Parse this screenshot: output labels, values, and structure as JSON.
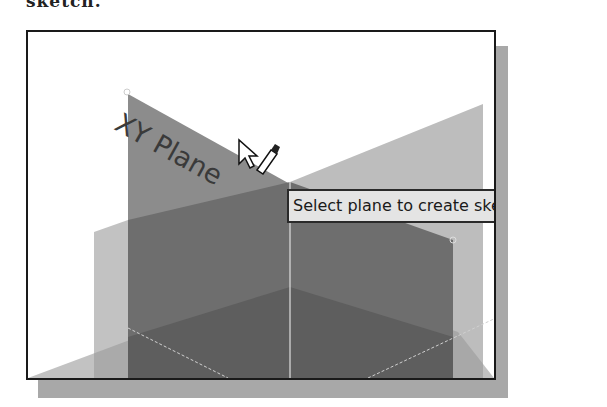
{
  "caption": {
    "text": "sketch."
  },
  "viewport": {
    "planes": [
      {
        "name": "XY Plane",
        "color": "#8c8c8c"
      },
      {
        "name": "back-plane",
        "color": "#bdbdbd"
      },
      {
        "name": "front-plane",
        "color": "#6e6e6e"
      },
      {
        "name": "floor-plane",
        "color": "#5e5e5e"
      }
    ],
    "hovered_plane_label": "XY Plane"
  },
  "tooltip": {
    "text": "Select plane to create sketch or"
  },
  "cursor": {
    "type": "arrow-with-sketch-pencil"
  },
  "colors": {
    "frame_border": "#1a1a1a",
    "shadow": "#a8a8a8",
    "tooltip_bg": "#e4e4e4"
  }
}
